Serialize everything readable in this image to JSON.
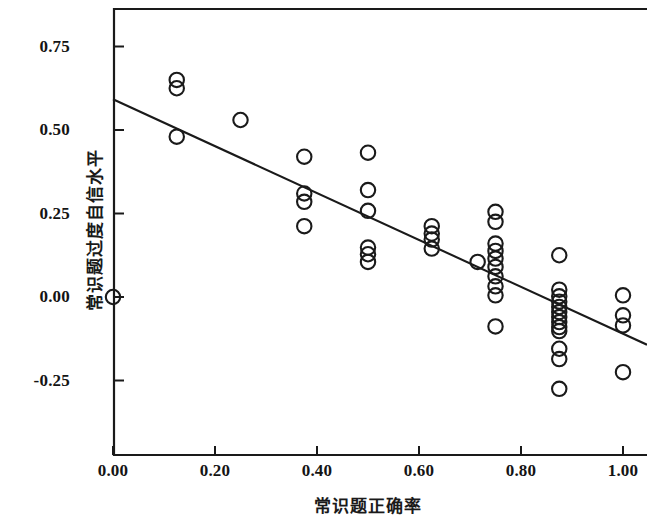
{
  "chart_data": {
    "type": "scatter",
    "title": "",
    "xlabel": "常识题正确率",
    "ylabel": "常识题过度自信水平",
    "xlim": [
      -0.03,
      1.05
    ],
    "ylim": [
      -0.36,
      0.86
    ],
    "grid": false,
    "legend": null,
    "marker": "open-circle",
    "xticks": [
      0.0,
      0.2,
      0.4,
      0.6,
      0.8,
      1.0
    ],
    "xtick_labels": [
      "0.00",
      "0.20",
      "0.40",
      "0.60",
      "0.80",
      "1.00"
    ],
    "yticks": [
      -0.25,
      0.0,
      0.25,
      0.5,
      0.75
    ],
    "ytick_labels": [
      "-0.25",
      "0.00",
      "0.25",
      "0.50",
      "0.75"
    ],
    "points": [
      [
        0.0,
        0.0
      ],
      [
        0.125,
        0.65
      ],
      [
        0.125,
        0.625
      ],
      [
        0.125,
        0.48
      ],
      [
        0.25,
        0.53
      ],
      [
        0.375,
        0.42
      ],
      [
        0.375,
        0.31
      ],
      [
        0.375,
        0.285
      ],
      [
        0.375,
        0.212
      ],
      [
        0.5,
        0.432
      ],
      [
        0.5,
        0.32
      ],
      [
        0.5,
        0.258
      ],
      [
        0.5,
        0.148
      ],
      [
        0.5,
        0.128
      ],
      [
        0.5,
        0.105
      ],
      [
        0.625,
        0.212
      ],
      [
        0.625,
        0.19
      ],
      [
        0.625,
        0.172
      ],
      [
        0.625,
        0.145
      ],
      [
        0.715,
        0.105
      ],
      [
        0.75,
        0.255
      ],
      [
        0.75,
        0.225
      ],
      [
        0.75,
        0.16
      ],
      [
        0.75,
        0.138
      ],
      [
        0.75,
        0.115
      ],
      [
        0.75,
        0.09
      ],
      [
        0.75,
        0.062
      ],
      [
        0.75,
        0.032
      ],
      [
        0.75,
        0.005
      ],
      [
        0.75,
        -0.088
      ],
      [
        0.875,
        0.125
      ],
      [
        0.875,
        0.022
      ],
      [
        0.875,
        0.002
      ],
      [
        0.875,
        -0.014
      ],
      [
        0.875,
        -0.03
      ],
      [
        0.875,
        -0.045
      ],
      [
        0.875,
        -0.06
      ],
      [
        0.875,
        -0.075
      ],
      [
        0.875,
        -0.09
      ],
      [
        0.875,
        -0.102
      ],
      [
        0.875,
        -0.155
      ],
      [
        0.875,
        -0.186
      ],
      [
        0.875,
        -0.275
      ],
      [
        1.0,
        0.005
      ],
      [
        1.0,
        -0.055
      ],
      [
        1.0,
        -0.085
      ],
      [
        1.0,
        -0.225
      ]
    ],
    "fit_line": {
      "type": "linear-regression",
      "x_start": 0.0,
      "y_start": 0.592,
      "x_end": 1.047,
      "y_end": -0.143
    }
  },
  "axes": {
    "x_tick_labels": [
      "0.00",
      "0.20",
      "0.40",
      "0.60",
      "0.80",
      "1.00"
    ],
    "y_tick_labels": [
      "0.75",
      "0.50",
      "0.25",
      "0.00",
      "-0.25"
    ],
    "x_title": "常识题正确率",
    "y_title": "常识题过度自信水平"
  },
  "style": {
    "axis_color": "#1a1a1a",
    "marker_color": "#1a1a1a",
    "line_color": "#1a1a1a",
    "background": "#ffffff"
  }
}
